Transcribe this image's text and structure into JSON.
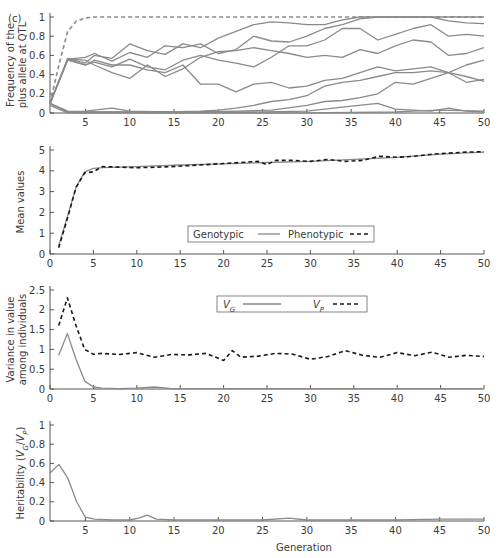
{
  "figure": {
    "panel_label": "(c)",
    "x_axis_label": "Generation"
  },
  "colors": {
    "gray_line": "#8a8a8a",
    "black_dash": "#1a1a1a",
    "axis": "#555555"
  },
  "chart_data": [
    {
      "id": "allele-frequency",
      "type": "line",
      "title": "",
      "xlabel": "",
      "ylabel": "Frequency of the plus allele at QTL",
      "ylabel_lines": [
        "Frequency of the",
        "plus allele at QTL"
      ],
      "xlim": [
        1,
        50
      ],
      "ylim": [
        0,
        1
      ],
      "xticks": [
        5,
        10,
        15,
        20,
        25,
        30,
        35,
        40,
        45,
        50
      ],
      "yticks": [
        0,
        0.2,
        0.4,
        0.6,
        0.8,
        1
      ],
      "ytick_labels": [
        "0",
        "0.2",
        "0.4",
        "0.6",
        "0.8",
        "1"
      ],
      "grid": false,
      "series": [
        {
          "name": "Expected (dashed)",
          "style": "dashed",
          "x": [
            1,
            2,
            3,
            4,
            5,
            6,
            10,
            20,
            30,
            40,
            50
          ],
          "y": [
            0.1,
            0.5,
            0.85,
            0.96,
            0.99,
            1,
            1,
            1,
            1,
            1,
            1
          ]
        },
        {
          "name": "QTL 1",
          "style": "solid",
          "x": [
            1,
            3,
            5,
            6,
            8,
            10,
            12,
            14,
            16,
            18,
            20,
            22,
            24,
            26,
            28,
            30,
            32,
            34,
            36,
            38,
            40,
            42,
            44,
            46,
            48,
            50
          ],
          "y": [
            0.1,
            0.57,
            0.52,
            0.6,
            0.57,
            0.72,
            0.65,
            0.61,
            0.72,
            0.68,
            0.78,
            0.85,
            0.92,
            0.95,
            0.94,
            0.92,
            0.92,
            0.97,
            1,
            1,
            1,
            1,
            1,
            1,
            1,
            1
          ]
        },
        {
          "name": "QTL 2",
          "style": "solid",
          "x": [
            1,
            3,
            5,
            6,
            8,
            10,
            12,
            14,
            16,
            18,
            20,
            22,
            24,
            26,
            28,
            30,
            32,
            34,
            36,
            38,
            40,
            42,
            44,
            46,
            48,
            50
          ],
          "y": [
            0.1,
            0.56,
            0.58,
            0.62,
            0.54,
            0.63,
            0.58,
            0.7,
            0.68,
            0.72,
            0.62,
            0.66,
            0.8,
            0.75,
            0.74,
            0.8,
            0.88,
            0.92,
            0.98,
            1,
            1,
            1,
            1,
            0.96,
            0.94,
            0.93
          ]
        },
        {
          "name": "QTL 3",
          "style": "solid",
          "x": [
            1,
            3,
            5,
            6,
            8,
            10,
            12,
            14,
            16,
            18,
            20,
            22,
            24,
            26,
            28,
            30,
            32,
            34,
            36,
            38,
            40,
            42,
            44,
            46,
            48,
            50
          ],
          "y": [
            0.1,
            0.56,
            0.5,
            0.53,
            0.48,
            0.56,
            0.48,
            0.45,
            0.55,
            0.6,
            0.55,
            0.52,
            0.48,
            0.58,
            0.7,
            0.7,
            0.76,
            0.88,
            0.88,
            0.76,
            0.82,
            0.88,
            0.92,
            0.8,
            0.82,
            0.8
          ]
        },
        {
          "name": "QTL 4",
          "style": "solid",
          "x": [
            1,
            3,
            5,
            6,
            8,
            10,
            12,
            14,
            16,
            18,
            20,
            22,
            24,
            26,
            28,
            30,
            32,
            34,
            36,
            38,
            40,
            42,
            44,
            46,
            48,
            50
          ],
          "y": [
            0.1,
            0.56,
            0.55,
            0.5,
            0.42,
            0.36,
            0.5,
            0.38,
            0.46,
            0.58,
            0.64,
            0.65,
            0.68,
            0.65,
            0.62,
            0.58,
            0.6,
            0.58,
            0.66,
            0.62,
            0.7,
            0.76,
            0.74,
            0.6,
            0.62,
            0.68
          ]
        },
        {
          "name": "QTL 5",
          "style": "solid",
          "x": [
            1,
            3,
            5,
            6,
            8,
            10,
            12,
            14,
            16,
            18,
            20,
            22,
            24,
            26,
            28,
            30,
            32,
            34,
            36,
            38,
            40,
            42,
            44,
            46,
            48,
            50
          ],
          "y": [
            0.1,
            0.55,
            0.5,
            0.55,
            0.5,
            0.5,
            0.45,
            0.42,
            0.5,
            0.3,
            0.3,
            0.22,
            0.3,
            0.32,
            0.26,
            0.28,
            0.34,
            0.36,
            0.42,
            0.48,
            0.44,
            0.46,
            0.48,
            0.42,
            0.5,
            0.55
          ]
        },
        {
          "name": "QTL 6",
          "style": "solid",
          "x": [
            1,
            3,
            5,
            8,
            10,
            14,
            18,
            20,
            22,
            24,
            26,
            28,
            30,
            32,
            34,
            36,
            38,
            40,
            42,
            44,
            46,
            48,
            50
          ],
          "y": [
            0.1,
            0.02,
            0.01,
            0.01,
            0.01,
            0.01,
            0.02,
            0.03,
            0.05,
            0.08,
            0.12,
            0.14,
            0.18,
            0.28,
            0.32,
            0.34,
            0.38,
            0.42,
            0.42,
            0.44,
            0.42,
            0.38,
            0.33
          ]
        },
        {
          "name": "QTL 7",
          "style": "solid",
          "x": [
            1,
            3,
            5,
            8,
            10,
            14,
            18,
            22,
            26,
            30,
            32,
            34,
            36,
            38,
            40,
            42,
            44,
            46,
            48,
            50
          ],
          "y": [
            0.1,
            0.01,
            0.02,
            0.05,
            0.02,
            0.01,
            0.01,
            0.02,
            0.03,
            0.08,
            0.12,
            0.13,
            0.16,
            0.2,
            0.32,
            0.3,
            0.36,
            0.42,
            0.32,
            0.35
          ]
        },
        {
          "name": "QTL 8",
          "style": "solid",
          "x": [
            1,
            3,
            5,
            10,
            15,
            20,
            25,
            30,
            34,
            38,
            40,
            44,
            46,
            48,
            50
          ],
          "y": [
            0.1,
            0.01,
            0.01,
            0.01,
            0.01,
            0.01,
            0.01,
            0.02,
            0.06,
            0.1,
            0.04,
            0.02,
            0.05,
            0.02,
            0.01
          ]
        },
        {
          "name": "QTL 9",
          "style": "solid",
          "x": [
            1,
            3,
            5,
            10,
            20,
            30,
            40,
            42,
            45,
            50
          ],
          "y": [
            0.08,
            0,
            0,
            0,
            0,
            0,
            0.01,
            0.02,
            0.03,
            0.02
          ]
        }
      ]
    },
    {
      "id": "mean-values",
      "type": "line",
      "title": "",
      "xlabel": "",
      "ylabel": "Mean values",
      "xlim": [
        0,
        50
      ],
      "ylim": [
        0,
        5
      ],
      "xticks": [
        0,
        5,
        10,
        15,
        20,
        25,
        30,
        35,
        40,
        45,
        50
      ],
      "yticks": [
        0,
        1,
        2,
        3,
        4,
        5
      ],
      "ytick_labels": [
        "0",
        "1",
        "2",
        "3",
        "4",
        "5"
      ],
      "grid": false,
      "legend": {
        "position": "lower-center",
        "entries": [
          "Genotypic",
          "Phenotypic"
        ]
      },
      "series": [
        {
          "name": "Genotypic",
          "style": "solid",
          "x": [
            1,
            2,
            3,
            4,
            5,
            6,
            10,
            15,
            20,
            25,
            30,
            35,
            40,
            45,
            50
          ],
          "y": [
            0.4,
            1.8,
            3.2,
            3.95,
            4.12,
            4.15,
            4.2,
            4.28,
            4.33,
            4.4,
            4.45,
            4.55,
            4.65,
            4.8,
            4.9
          ]
        },
        {
          "name": "Phenotypic",
          "style": "dashed",
          "x": [
            1,
            2,
            3,
            4,
            5,
            6,
            8,
            10,
            12,
            14,
            16,
            18,
            20,
            22,
            24,
            25,
            26,
            28,
            30,
            32,
            34,
            36,
            38,
            40,
            42,
            44,
            46,
            48,
            50
          ],
          "y": [
            0.3,
            1.7,
            3.2,
            3.9,
            3.95,
            4.2,
            4.18,
            4.15,
            4.17,
            4.2,
            4.25,
            4.3,
            4.35,
            4.4,
            4.45,
            4.3,
            4.5,
            4.5,
            4.45,
            4.55,
            4.45,
            4.5,
            4.7,
            4.65,
            4.7,
            4.8,
            4.85,
            4.9,
            4.92
          ]
        }
      ]
    },
    {
      "id": "variance",
      "type": "line",
      "title": "",
      "xlabel": "",
      "ylabel": "Variance in value among individuals",
      "ylabel_lines": [
        "Variance in value",
        "among individuals"
      ],
      "xlim": [
        0,
        50
      ],
      "ylim": [
        0,
        2.5
      ],
      "xticks": [
        0,
        5,
        10,
        15,
        20,
        25,
        30,
        35,
        40,
        45,
        50
      ],
      "yticks": [
        0,
        0.5,
        1,
        1.5,
        2,
        2.5
      ],
      "ytick_labels": [
        "0",
        "0.5",
        "1",
        "1.5",
        "2",
        "2.5"
      ],
      "grid": false,
      "legend": {
        "position": "upper-right",
        "entries": [
          "V_G",
          "V_P"
        ]
      },
      "series": [
        {
          "name": "V_G",
          "style": "solid",
          "x": [
            1,
            2,
            3,
            4,
            5,
            6,
            8,
            10,
            12,
            14,
            20,
            30,
            40,
            50
          ],
          "y": [
            0.85,
            1.4,
            0.75,
            0.2,
            0.05,
            0.02,
            0.01,
            0.02,
            0.05,
            0.01,
            0.01,
            0.01,
            0.01,
            0.01
          ]
        },
        {
          "name": "V_P",
          "style": "dashed",
          "x": [
            1,
            2,
            3,
            4,
            5,
            6,
            8,
            10,
            12,
            14,
            16,
            18,
            20,
            21,
            22,
            24,
            26,
            28,
            30,
            32,
            34,
            36,
            38,
            40,
            42,
            44,
            46,
            48,
            50
          ],
          "y": [
            1.6,
            2.3,
            1.6,
            1.0,
            0.88,
            0.9,
            0.87,
            0.92,
            0.8,
            0.87,
            0.86,
            0.9,
            0.72,
            0.97,
            0.8,
            0.83,
            0.9,
            0.88,
            0.75,
            0.82,
            0.97,
            0.85,
            0.8,
            0.92,
            0.84,
            0.93,
            0.8,
            0.85,
            0.82
          ]
        }
      ]
    },
    {
      "id": "heritability",
      "type": "line",
      "title": "",
      "xlabel": "Generation",
      "ylabel": "Heritability (V_G/V_P)",
      "xlim": [
        1,
        50
      ],
      "ylim": [
        0,
        1
      ],
      "xticks": [
        5,
        10,
        15,
        20,
        25,
        30,
        35,
        40,
        45,
        50
      ],
      "yticks": [
        0,
        0.2,
        0.4,
        0.6,
        0.8,
        1
      ],
      "ytick_labels": [
        "0",
        "0.2",
        "0.4",
        "0.6",
        "0.8",
        "1"
      ],
      "grid": false,
      "series": [
        {
          "name": "Heritability",
          "style": "solid",
          "x": [
            1,
            2,
            3,
            4,
            5,
            6,
            8,
            10,
            11,
            12,
            13,
            15,
            20,
            25,
            28,
            30,
            35,
            40,
            45,
            50
          ],
          "y": [
            0.5,
            0.59,
            0.45,
            0.2,
            0.04,
            0.02,
            0.01,
            0.01,
            0.03,
            0.06,
            0.02,
            0.01,
            0.01,
            0.01,
            0.03,
            0.01,
            0.01,
            0.01,
            0.02,
            0.02
          ]
        }
      ]
    }
  ]
}
